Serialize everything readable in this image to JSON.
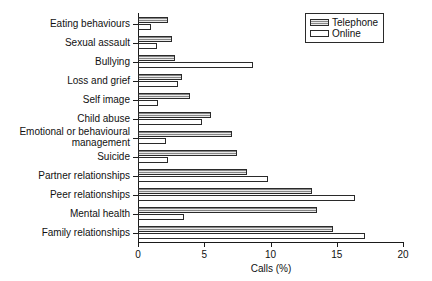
{
  "chart_data": {
    "type": "bar",
    "orientation": "horizontal",
    "title": "",
    "xlabel": "Calls (%)",
    "ylabel": "",
    "xlim": [
      0,
      20
    ],
    "xticks": [
      0,
      5,
      10,
      15,
      20
    ],
    "xtick_labels": [
      "0",
      "5",
      "10",
      "15",
      "20"
    ],
    "grid": false,
    "legend_position": "top-right",
    "categories": [
      "Eating behaviours",
      "Sexual assault",
      "Bullying",
      "Loss and grief",
      "Self image",
      "Child abuse",
      "Emotional or behavioural\nmanagement",
      "Suicide",
      "Partner relationships",
      "Peer relationships",
      "Mental health",
      "Family relationships"
    ],
    "series": [
      {
        "name": "Telephone",
        "color": "#a8a8a8",
        "values": [
          2.3,
          2.6,
          2.8,
          3.3,
          3.9,
          5.5,
          7.1,
          7.5,
          8.2,
          13.1,
          13.5,
          14.7
        ]
      },
      {
        "name": "Online",
        "color": "#ffffff",
        "values": [
          1.0,
          1.4,
          8.7,
          3.0,
          1.5,
          4.8,
          2.1,
          2.3,
          9.8,
          16.4,
          3.5,
          17.1
        ]
      }
    ]
  },
  "legend": {
    "items": [
      {
        "label": "Telephone"
      },
      {
        "label": "Online"
      }
    ]
  },
  "axes": {
    "x_title": "Calls (%)"
  }
}
